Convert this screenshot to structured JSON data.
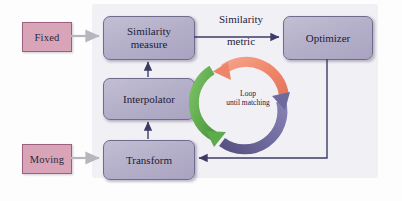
{
  "diagram": {
    "panel": {
      "background_color": "#f1f0f5"
    },
    "input_boxes": [
      {
        "id": "fixed",
        "label": "Fixed",
        "color": "#d9a3b8"
      },
      {
        "id": "moving",
        "label": "Moving",
        "color": "#d9a3b8"
      }
    ],
    "process_boxes": [
      {
        "id": "similarity-measure",
        "line1": "Similarity",
        "line2": "measure",
        "color": "#b3aec8"
      },
      {
        "id": "optimizer",
        "line1": "Optimizer",
        "line2": "",
        "color": "#b3aec8"
      },
      {
        "id": "interpolator",
        "line1": "Interpolator",
        "line2": "",
        "color": "#b3aec8"
      },
      {
        "id": "transform",
        "line1": "Transform",
        "line2": "",
        "color": "#b3aec8"
      }
    ],
    "edge_labels": [
      {
        "id": "similarity-metric",
        "line1": "Similarity",
        "line2": "metric"
      }
    ],
    "loop": {
      "line1": "Loop",
      "line2": "until matching",
      "arcs": [
        {
          "id": "arc-salmon",
          "color": "#ee8468",
          "position": "top-right",
          "direction": "counter-clockwise"
        },
        {
          "id": "arc-purple",
          "color": "#6f6a9e",
          "position": "bottom-right",
          "direction": "clockwise-up"
        },
        {
          "id": "arc-green",
          "color": "#5eab4c",
          "position": "left",
          "direction": "downward"
        }
      ]
    },
    "connector_colors": {
      "input_arrow": "#b6b6bd",
      "internal_arrow": "#3b3b66"
    }
  }
}
